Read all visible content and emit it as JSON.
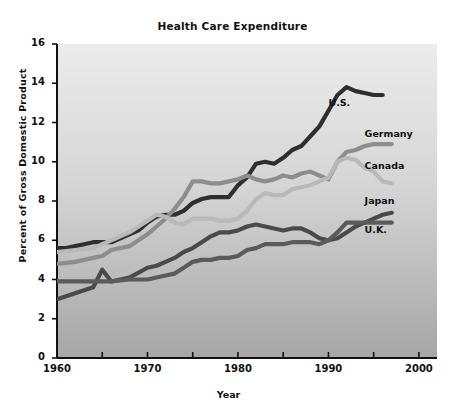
{
  "chart_data": {
    "type": "line",
    "title": "Health Care Expenditure",
    "xlabel": "Year",
    "ylabel": "Percent of Gross Domestic Product",
    "xlim": [
      1960,
      2002
    ],
    "ylim": [
      0,
      16
    ],
    "grid": false,
    "legend_position": "inline-right-of-line-ends",
    "x_ticks_major": [
      1960,
      1970,
      1980,
      1990,
      2000
    ],
    "x_ticks_minor": [
      1965,
      1975,
      1985,
      1995
    ],
    "y_ticks": [
      0,
      2,
      4,
      6,
      8,
      10,
      12,
      14,
      16
    ],
    "x_tick_labels": [
      "1960",
      "1970",
      "1980",
      "1990",
      "2000"
    ],
    "y_tick_labels": [
      "0",
      "2",
      "4",
      "6",
      "8",
      "10",
      "12",
      "14",
      "16"
    ],
    "series": [
      {
        "name": "U.S.",
        "color": "#2f2f2f",
        "label": "U.S.",
        "label_x": 1990,
        "label_y": 13.0,
        "x": [
          1960,
          1961,
          1962,
          1963,
          1964,
          1965,
          1966,
          1967,
          1968,
          1969,
          1970,
          1971,
          1972,
          1973,
          1974,
          1975,
          1976,
          1977,
          1978,
          1979,
          1980,
          1981,
          1982,
          1983,
          1984,
          1985,
          1986,
          1987,
          1988,
          1989,
          1990,
          1991,
          1992,
          1993,
          1994,
          1995,
          1996
        ],
        "values": [
          5.6,
          5.6,
          5.7,
          5.8,
          5.9,
          5.9,
          5.9,
          6.1,
          6.3,
          6.5,
          6.9,
          7.2,
          7.3,
          7.3,
          7.5,
          7.9,
          8.1,
          8.2,
          8.2,
          8.2,
          8.8,
          9.2,
          9.9,
          10.0,
          9.9,
          10.2,
          10.6,
          10.8,
          11.3,
          11.8,
          12.6,
          13.4,
          13.8,
          13.6,
          13.5,
          13.4,
          13.4
        ]
      },
      {
        "name": "Germany",
        "color": "#8d8d8d",
        "label": "Germany",
        "label_x": 1994,
        "label_y": 11.4,
        "x": [
          1960,
          1962,
          1964,
          1965,
          1966,
          1968,
          1970,
          1971,
          1972,
          1973,
          1974,
          1975,
          1976,
          1977,
          1978,
          1979,
          1980,
          1981,
          1982,
          1983,
          1984,
          1985,
          1986,
          1987,
          1988,
          1989,
          1990,
          1991,
          1992,
          1993,
          1994,
          1995,
          1996,
          1997
        ],
        "values": [
          4.8,
          4.9,
          5.1,
          5.2,
          5.5,
          5.7,
          6.3,
          6.7,
          7.1,
          7.6,
          8.2,
          9.0,
          9.0,
          8.9,
          8.9,
          9.0,
          9.1,
          9.3,
          9.1,
          9.0,
          9.1,
          9.3,
          9.2,
          9.4,
          9.5,
          9.3,
          9.1,
          10.0,
          10.5,
          10.6,
          10.8,
          10.9,
          10.9,
          10.9
        ]
      },
      {
        "name": "Canada",
        "color": "#b9b9b9",
        "label": "Canada",
        "label_x": 1994,
        "label_y": 9.8,
        "x": [
          1960,
          1962,
          1964,
          1965,
          1966,
          1968,
          1970,
          1971,
          1972,
          1973,
          1974,
          1975,
          1976,
          1977,
          1978,
          1979,
          1980,
          1981,
          1982,
          1983,
          1984,
          1985,
          1986,
          1987,
          1988,
          1989,
          1990,
          1991,
          1992,
          1993,
          1994,
          1995,
          1996,
          1997
        ],
        "values": [
          5.4,
          5.5,
          5.6,
          5.8,
          6.0,
          6.4,
          7.0,
          7.3,
          7.2,
          6.9,
          6.8,
          7.1,
          7.1,
          7.1,
          7.0,
          7.0,
          7.1,
          7.5,
          8.1,
          8.4,
          8.3,
          8.3,
          8.6,
          8.7,
          8.8,
          9.0,
          9.2,
          10.0,
          10.2,
          10.1,
          9.7,
          9.5,
          9.0,
          8.9
        ]
      },
      {
        "name": "Japan",
        "color": "#4a4a4a",
        "label": "Japan",
        "label_x": 1994,
        "label_y": 8.0,
        "x": [
          1960,
          1962,
          1964,
          1965,
          1966,
          1968,
          1970,
          1971,
          1972,
          1973,
          1974,
          1975,
          1976,
          1977,
          1978,
          1979,
          1980,
          1981,
          1982,
          1983,
          1984,
          1985,
          1986,
          1987,
          1988,
          1989,
          1990,
          1991,
          1992,
          1993,
          1994,
          1995,
          1996,
          1997
        ],
        "values": [
          3.0,
          3.3,
          3.6,
          4.5,
          3.9,
          4.1,
          4.6,
          4.7,
          4.9,
          5.1,
          5.4,
          5.6,
          5.9,
          6.2,
          6.4,
          6.4,
          6.5,
          6.7,
          6.8,
          6.7,
          6.6,
          6.5,
          6.6,
          6.6,
          6.4,
          6.1,
          6.0,
          6.1,
          6.4,
          6.7,
          6.9,
          7.1,
          7.3,
          7.4
        ]
      },
      {
        "name": "U.K.",
        "color": "#5b5b5b",
        "label": "U.K.",
        "label_x": 1994,
        "label_y": 6.5,
        "x": [
          1960,
          1962,
          1964,
          1965,
          1966,
          1968,
          1970,
          1971,
          1972,
          1973,
          1974,
          1975,
          1976,
          1977,
          1978,
          1979,
          1980,
          1981,
          1982,
          1983,
          1984,
          1985,
          1986,
          1987,
          1988,
          1989,
          1990,
          1991,
          1992,
          1993,
          1994,
          1995,
          1996,
          1997
        ],
        "values": [
          3.9,
          3.9,
          3.9,
          3.9,
          3.9,
          4.0,
          4.0,
          4.1,
          4.2,
          4.3,
          4.6,
          4.9,
          5.0,
          5.0,
          5.1,
          5.1,
          5.2,
          5.5,
          5.6,
          5.8,
          5.8,
          5.8,
          5.9,
          5.9,
          5.9,
          5.8,
          6.0,
          6.4,
          6.9,
          6.9,
          6.9,
          6.9,
          6.9,
          6.9
        ]
      }
    ]
  },
  "axis_geometry": {
    "plot_left": 57,
    "plot_right": 437,
    "plot_top": 44,
    "plot_bottom": 358
  }
}
